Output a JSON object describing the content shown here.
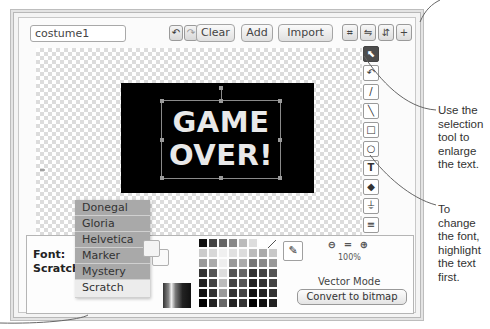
{
  "toolbar": {
    "costume_name": "costume1",
    "undo_icon": "undo-icon",
    "redo_icon": "redo-icon",
    "clear_label": "Clear",
    "add_label": "Add",
    "import_label": "Import",
    "shape_tools": [
      "crop-icon",
      "flip-horizontal-icon",
      "flip-vertical-icon",
      "set-center-icon"
    ]
  },
  "canvas": {
    "text_line1": "GAME",
    "text_line2": "OVER!"
  },
  "tools": [
    {
      "name": "select-tool",
      "glyph": "⬉",
      "active": true
    },
    {
      "name": "reshape-tool",
      "glyph": "↶",
      "active": false
    },
    {
      "name": "pencil-tool",
      "glyph": "/",
      "active": false
    },
    {
      "name": "line-tool",
      "glyph": "╲",
      "active": false
    },
    {
      "name": "rectangle-tool",
      "glyph": "□",
      "active": false
    },
    {
      "name": "ellipse-tool",
      "glyph": "○",
      "active": false
    },
    {
      "name": "text-tool",
      "glyph": "T",
      "active": false
    },
    {
      "name": "fill-tool",
      "glyph": "◆",
      "active": false
    },
    {
      "name": "stamp-tool",
      "glyph": "⏚",
      "active": false
    },
    {
      "name": "forward-layer-tool",
      "glyph": "≡",
      "active": false
    },
    {
      "name": "back-layer-tool",
      "glyph": "≡",
      "active": false
    }
  ],
  "font": {
    "label": "Font:",
    "current": "Scratch ▾",
    "options": [
      "Donegal",
      "Gloria",
      "Helvetica",
      "Marker",
      "Mystery",
      "Scratch"
    ],
    "selected": "Scratch"
  },
  "palette": {
    "colors": [
      "#111111",
      "#444444",
      "#666666",
      "#888888",
      "#bbbbbb",
      "#dddddd",
      "#ffffff",
      "#ffffff",
      "#cccccc",
      "#d8d8d8",
      "#f0f0f0",
      "#e0e0e0",
      "#dcdcdc",
      "#bbbbbb",
      "#aaaaaa",
      "#c8c8c8",
      "#999999",
      "#aaaaaa",
      "#eeeeee",
      "#999999",
      "#aaaaaa",
      "#777777",
      "#888888",
      "#999999",
      "#333333",
      "#555555",
      "#dddddd",
      "#555555",
      "#666666",
      "#333333",
      "#444444",
      "#555555",
      "#222222",
      "#444444",
      "#bbbbbb",
      "#444444",
      "#555555",
      "#222222",
      "#333333",
      "#444444",
      "#111111",
      "#333333",
      "#999999",
      "#333333",
      "#444444",
      "#111111",
      "#222222",
      "#333333",
      "#000000",
      "#222222",
      "#666666",
      "#222222",
      "#333333",
      "#000000",
      "#111111",
      "#222222"
    ]
  },
  "zoom": {
    "zoom_out_icon": "zoom-out-icon",
    "reset_icon": "zoom-reset-icon",
    "zoom_in_icon": "zoom-in-icon",
    "level": "100%"
  },
  "mode": {
    "label": "Vector Mode",
    "convert_label": "Convert to bitmap"
  },
  "annotations": {
    "selection_tip": "Use the selection tool to enlarge the text.",
    "font_tip": "To change the font, highlight the text first."
  }
}
